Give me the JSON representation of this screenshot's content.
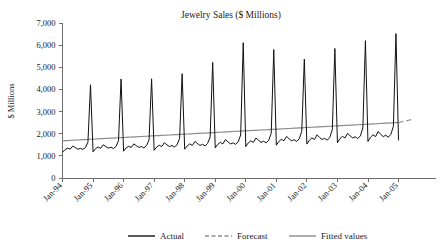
{
  "chart_data": {
    "type": "line",
    "title": "Jewelry Sales ($ Millions)",
    "xlabel": "",
    "ylabel": "$ Millions",
    "ylim": [
      0,
      7000
    ],
    "ytick_labels": [
      "0",
      "1,000",
      "2,000",
      "3,000",
      "4,000",
      "5,000",
      "6,000",
      "7,000"
    ],
    "ytick_values": [
      0,
      1000,
      2000,
      3000,
      4000,
      5000,
      6000,
      7000
    ],
    "xtick_labels": [
      "Jan-94",
      "Jan-95",
      "Jan-96",
      "Jan-97",
      "Jan-98",
      "Jan-99",
      "Jan-00",
      "Jan-01",
      "Jan-02",
      "Jan-03",
      "Jan-04",
      "Jan-05"
    ],
    "xtick_index": [
      0,
      12,
      24,
      36,
      48,
      60,
      72,
      84,
      96,
      108,
      120,
      132
    ],
    "grid": false,
    "legend_position": "bottom",
    "legend": [
      "Actual",
      "Forecast",
      "Fitted values"
    ],
    "colors": {
      "actual": "#111111",
      "forecast": "#8c8c8c",
      "fitted": "#8c8c8c",
      "axis": "#6e6e6e",
      "background": "#ffffff"
    },
    "x_start": "Jan-94",
    "x_end": "Jan-05",
    "series": [
      {
        "name": "Actual",
        "style": "solid",
        "color": "#111111",
        "values": [
          1160,
          1280,
          1350,
          1300,
          1440,
          1380,
          1300,
          1340,
          1290,
          1370,
          1620,
          4210,
          1180,
          1330,
          1400,
          1340,
          1500,
          1420,
          1350,
          1390,
          1330,
          1420,
          1680,
          4470,
          1210,
          1360,
          1430,
          1380,
          1540,
          1460,
          1380,
          1420,
          1360,
          1460,
          1720,
          4480,
          1250,
          1400,
          1480,
          1420,
          1590,
          1500,
          1420,
          1470,
          1400,
          1500,
          1780,
          4710,
          1300,
          1450,
          1540,
          1470,
          1650,
          1560,
          1470,
          1520,
          1450,
          1560,
          1850,
          5220,
          1360,
          1520,
          1610,
          1540,
          1730,
          1630,
          1540,
          1590,
          1520,
          1630,
          1940,
          6110,
          1420,
          1590,
          1680,
          1610,
          1810,
          1700,
          1610,
          1660,
          1590,
          1700,
          2020,
          5800,
          1480,
          1650,
          1750,
          1680,
          1880,
          1770,
          1680,
          1730,
          1650,
          1770,
          2100,
          5370,
          1530,
          1710,
          1810,
          1740,
          1950,
          1830,
          1740,
          1790,
          1710,
          1830,
          2180,
          5850,
          1590,
          1780,
          1880,
          1810,
          2020,
          1900,
          1810,
          1860,
          1780,
          1900,
          2260,
          6200,
          1650,
          1840,
          1950,
          1870,
          2100,
          1970,
          1870,
          1930,
          1840,
          1970,
          2340,
          6520,
          1700
        ]
      },
      {
        "name": "Fitted values",
        "style": "solid",
        "color": "#8c8c8c",
        "values": [
          1680,
          1686,
          1692,
          1699,
          1705,
          1711,
          1717,
          1724,
          1730,
          1736,
          1742,
          1749,
          1755,
          1761,
          1767,
          1774,
          1780,
          1786,
          1792,
          1799,
          1805,
          1811,
          1817,
          1824,
          1830,
          1836,
          1842,
          1849,
          1855,
          1861,
          1867,
          1874,
          1880,
          1886,
          1892,
          1899,
          1905,
          1911,
          1917,
          1924,
          1930,
          1936,
          1942,
          1949,
          1955,
          1961,
          1967,
          1974,
          1980,
          1986,
          1992,
          1999,
          2005,
          2011,
          2017,
          2024,
          2030,
          2036,
          2042,
          2049,
          2055,
          2061,
          2067,
          2074,
          2080,
          2086,
          2092,
          2099,
          2105,
          2111,
          2117,
          2124,
          2130,
          2136,
          2142,
          2149,
          2155,
          2161,
          2167,
          2174,
          2180,
          2186,
          2192,
          2199,
          2205,
          2211,
          2217,
          2224,
          2230,
          2236,
          2242,
          2249,
          2255,
          2261,
          2267,
          2274,
          2280,
          2286,
          2292,
          2299,
          2305,
          2311,
          2317,
          2324,
          2330,
          2336,
          2342,
          2349,
          2355,
          2361,
          2367,
          2374,
          2380,
          2386,
          2392,
          2399,
          2405,
          2411,
          2417,
          2424,
          2430,
          2436,
          2442,
          2449,
          2455,
          2461,
          2467,
          2474,
          2480,
          2486,
          2492,
          2499,
          2505
        ]
      },
      {
        "name": "Forecast",
        "style": "dashed",
        "color": "#8c8c8c",
        "start_index": 132,
        "values": [
          2505,
          2530,
          2556,
          2582,
          2608,
          2634,
          2660
        ]
      }
    ],
    "annotations": [
      {
        "label": "December seasonal peaks",
        "note": "Actual series spikes each December"
      }
    ]
  }
}
